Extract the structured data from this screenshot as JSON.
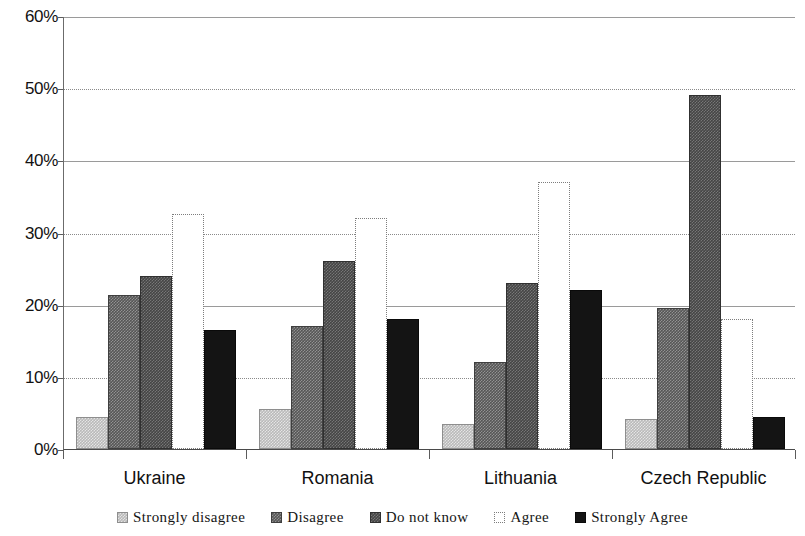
{
  "chart_data": {
    "type": "bar",
    "title": "",
    "xlabel": "",
    "ylabel": "",
    "ylim": [
      0,
      60
    ],
    "ytick_labels": [
      "0%",
      "10%",
      "20%",
      "30%",
      "40%",
      "50%",
      "60%"
    ],
    "ytick_values": [
      0,
      10,
      20,
      30,
      40,
      50,
      60
    ],
    "grid": true,
    "legend_position": "bottom",
    "categories": [
      "Ukraine",
      "Romania",
      "Lithuania",
      "Czech Republic"
    ],
    "series": [
      {
        "name": "Strongly disagree",
        "color": "#b9b9b9",
        "values": [
          4.5,
          5.5,
          3.5,
          4.2
        ]
      },
      {
        "name": "Disagree",
        "color": "#565656",
        "values": [
          21.3,
          17.0,
          12.0,
          19.5
        ]
      },
      {
        "name": "Do not know",
        "color": "#454545",
        "values": [
          24.0,
          26.0,
          23.0,
          49.0
        ]
      },
      {
        "name": "Agree",
        "color": "#ffffff",
        "values": [
          32.5,
          32.0,
          37.0,
          18.0
        ]
      },
      {
        "name": "Strongly Agree",
        "color": "#141414",
        "values": [
          16.5,
          18.0,
          22.0,
          4.5
        ]
      }
    ]
  },
  "legend": {
    "items": [
      {
        "label": "Strongly disagree"
      },
      {
        "label": "Disagree"
      },
      {
        "label": "Do not know"
      },
      {
        "label": "Agree"
      },
      {
        "label": "Strongly Agree"
      }
    ]
  }
}
